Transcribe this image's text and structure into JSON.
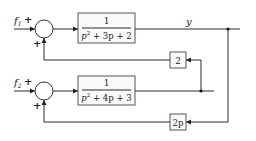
{
  "diagram": {
    "inputs": [
      {
        "symbol": "f",
        "subscript": "1",
        "sign": "+"
      },
      {
        "symbol": "f",
        "subscript": "2",
        "sign": "+"
      }
    ],
    "summing_junctions": [
      {
        "feedback_sign": "+"
      },
      {
        "feedback_sign": "+"
      }
    ],
    "blocks": [
      {
        "numerator": "1",
        "denominator": {
          "p_squared": "p",
          "exp": "2",
          "rest": " + 3p + 2"
        }
      },
      {
        "numerator": "1",
        "denominator": {
          "p_squared": "p",
          "exp": "2",
          "rest": " + 4p + 3"
        }
      }
    ],
    "feedback_blocks": [
      {
        "gain": "2"
      },
      {
        "gain": "2p"
      }
    ],
    "output_label": "y"
  }
}
